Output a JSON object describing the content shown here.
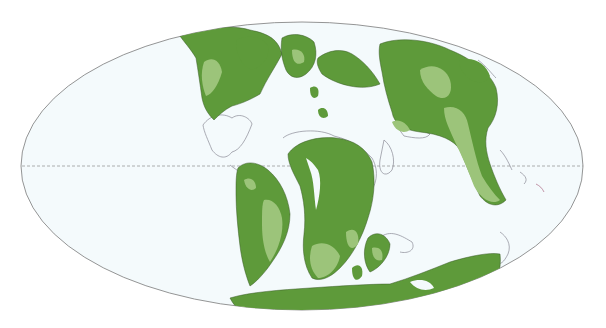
{
  "map": {
    "type": "paleogeographic-world-map",
    "projection": "mollweide",
    "labels": [],
    "colors": {
      "background": "#ffffff",
      "ocean": "#f4fafc",
      "land_dark": "#5e9a3a",
      "land_light": "#9cc47a",
      "modern_outline": "#8a8a95",
      "coastline_dark": "#3a5a28",
      "frame": "#7a7a7a",
      "equator": "#999999"
    },
    "features": {
      "equator": "dashed line",
      "frame": "ellipse outline"
    }
  }
}
